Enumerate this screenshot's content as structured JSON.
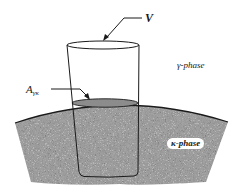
{
  "diagram": {
    "labels": {
      "volume": "V",
      "interface_area_main": "A",
      "interface_area_sub": "γκ",
      "upper_phase": "γ-phase",
      "lower_phase": "κ-phase"
    },
    "colors": {
      "line": "#1a1a1a",
      "kappa_fill": "#b5b5b5",
      "interface_fill": "#8c8c8c",
      "background": "#ffffff"
    }
  }
}
